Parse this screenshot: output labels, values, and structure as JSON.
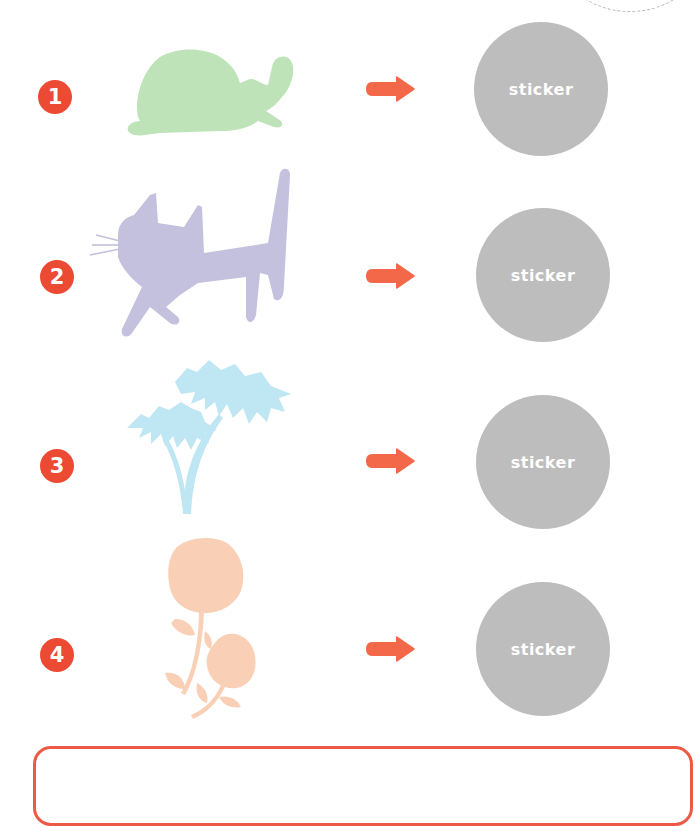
{
  "colors": {
    "accent": "#ec4a33",
    "arrow": "#f26848",
    "sticker_bg": "#bdbdbd",
    "turtle": "#bfe3b8",
    "cat": "#c3c1dd",
    "palm": "#bfe6f3",
    "rose": "#f9d0b6"
  },
  "rows": [
    {
      "number": "1",
      "image": "turtle-silhouette",
      "sticker_label": "sticker"
    },
    {
      "number": "2",
      "image": "cat-silhouette",
      "sticker_label": "sticker"
    },
    {
      "number": "3",
      "image": "palm-tree-silhouette",
      "sticker_label": "sticker"
    },
    {
      "number": "4",
      "image": "rose-silhouette",
      "sticker_label": "sticker"
    }
  ]
}
